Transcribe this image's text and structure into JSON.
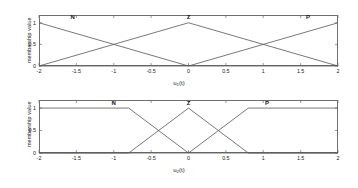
{
  "figure": {
    "background": "#ffffff",
    "line_color": "#555555",
    "axis_color": "#6f6f6f",
    "text_color": "#1a1a1a"
  },
  "chart_data": [
    {
      "type": "line",
      "title": "",
      "xlabel": "u₁(t)",
      "xlabel_base": "u",
      "xlabel_sub": "1",
      "xlabel_tail": "(t)",
      "ylabel": "membership value",
      "xlim": [
        -2,
        2
      ],
      "ylim": [
        0,
        1.18
      ],
      "grid": false,
      "xticks": [
        -2,
        -1.5,
        -1,
        -0.5,
        0,
        0.5,
        1,
        1.5,
        2
      ],
      "xticklabels": [
        "-2",
        "-1.5",
        "-1",
        "-0.5",
        "0",
        "0.5",
        "1",
        "1.5",
        "2"
      ],
      "yticks": [
        0,
        0.5,
        1
      ],
      "yticklabels": [
        "0",
        "0.5",
        "1"
      ],
      "annotations": [
        {
          "text": "N",
          "x": -1.55,
          "y": 1.1
        },
        {
          "text": "Z",
          "x": 0.0,
          "y": 1.1
        },
        {
          "text": "P",
          "x": 1.6,
          "y": 1.1
        }
      ],
      "series": [
        {
          "name": "N",
          "points": [
            [
              -2,
              1
            ],
            [
              0,
              0
            ],
            [
              2,
              0
            ]
          ]
        },
        {
          "name": "Z",
          "points": [
            [
              -2,
              0
            ],
            [
              0,
              1
            ],
            [
              2,
              0
            ]
          ]
        },
        {
          "name": "P",
          "points": [
            [
              -2,
              0
            ],
            [
              0,
              0
            ],
            [
              2,
              1
            ]
          ]
        }
      ]
    },
    {
      "type": "line",
      "title": "",
      "xlabel": "u₂(t)",
      "xlabel_base": "u",
      "xlabel_sub": "2",
      "xlabel_tail": "(t)",
      "ylabel": "membership value",
      "xlim": [
        -2,
        2
      ],
      "ylim": [
        0,
        1.18
      ],
      "grid": false,
      "xticks": [
        -2,
        -1.5,
        -1,
        -0.5,
        0,
        0.5,
        1,
        1.5,
        2
      ],
      "xticklabels": [
        "-2",
        "-1.5",
        "-1",
        "-0.5",
        "0",
        "0.5",
        "1",
        "1.5",
        "2"
      ],
      "yticks": [
        0,
        0.5,
        1
      ],
      "yticklabels": [
        "0",
        "0.5",
        "1"
      ],
      "annotations": [
        {
          "text": "N",
          "x": -1.0,
          "y": 1.1
        },
        {
          "text": "Z",
          "x": 0.0,
          "y": 1.1
        },
        {
          "text": "P",
          "x": 1.05,
          "y": 1.1
        }
      ],
      "series": [
        {
          "name": "N",
          "points": [
            [
              -2,
              1
            ],
            [
              -0.8,
              1
            ],
            [
              0,
              0
            ],
            [
              2,
              0
            ]
          ]
        },
        {
          "name": "Z",
          "points": [
            [
              -2,
              0
            ],
            [
              -0.8,
              0
            ],
            [
              0,
              1
            ],
            [
              0.8,
              0
            ],
            [
              2,
              0
            ]
          ]
        },
        {
          "name": "P",
          "points": [
            [
              -2,
              0
            ],
            [
              0,
              0
            ],
            [
              0.8,
              1
            ],
            [
              2,
              1
            ]
          ]
        }
      ]
    }
  ]
}
